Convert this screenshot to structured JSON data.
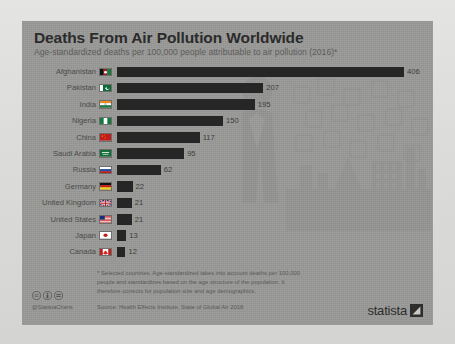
{
  "panel": {
    "background_color": "#9a9a98",
    "bar_color": "#262626"
  },
  "header": {
    "title": "Deaths From Air Pollution Worldwide",
    "subtitle": "Age-standardized deaths per 100,000 people attributable to air pollution (2016)*"
  },
  "chart_data": {
    "type": "bar",
    "orientation": "horizontal",
    "title": "Deaths From Air Pollution Worldwide",
    "subtitle": "Age-standardized deaths per 100,000 people attributable to air pollution (2016)*",
    "xlabel": "",
    "ylabel": "",
    "xlim": [
      0,
      406
    ],
    "grid": false,
    "legend": false,
    "categories": [
      "Afghanistan",
      "Pakistan",
      "India",
      "Nigeria",
      "China",
      "Saudi Arabia",
      "Russia",
      "Germany",
      "United Kingdom",
      "United States",
      "Japan",
      "Canada"
    ],
    "values": [
      406,
      207,
      195,
      150,
      117,
      95,
      62,
      22,
      21,
      21,
      13,
      12
    ],
    "value_labels": [
      "406",
      "207",
      "195",
      "150",
      "117",
      "95",
      "62",
      "22",
      "21",
      "21",
      "13",
      "12"
    ],
    "flags": [
      "flag-afghanistan",
      "flag-pakistan",
      "flag-india",
      "flag-nigeria",
      "flag-china",
      "flag-saudi-arabia",
      "flag-russia",
      "flag-germany",
      "flag-united-kingdom",
      "flag-united-states",
      "flag-japan",
      "flag-canada"
    ]
  },
  "footer": {
    "footnote": "* Selected countries. Age-standardized takes into account deaths per 100,000 people and standardizes based on the age structure of the population. It therefore corrects for population size and age demographics.",
    "source": "Source: Health Effects Institute, State of Global Air 2018",
    "handle": "@StatistaCharts",
    "license_icons": [
      "cc-icon",
      "cc-by-icon",
      "cc-nd-icon"
    ],
    "brand": "statista",
    "brand_mark": "statista-arrow-icon"
  }
}
